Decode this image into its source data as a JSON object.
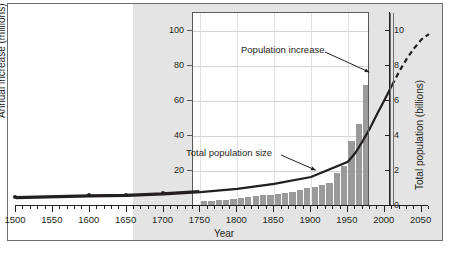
{
  "chart_data": {
    "type": "bar",
    "title": "",
    "subtitle": "",
    "xlabel": "Year",
    "ylabel": "Annual increase (millions)",
    "y2label": "Total population (billions)",
    "xlim": [
      1500,
      2060
    ],
    "ylim": [
      0,
      110
    ],
    "y2lim": [
      0,
      11
    ],
    "grid": true,
    "legend_position": "none",
    "x_major_ticks": [
      1500,
      1550,
      1600,
      1650,
      1700,
      1750,
      1800,
      1850,
      1900,
      1950,
      2000,
      2050
    ],
    "x_minor_tick_interval": 10,
    "y_ticks_left": [
      20,
      40,
      60,
      80,
      100
    ],
    "y_ticks_right": [
      0,
      2,
      4,
      6,
      8,
      10
    ],
    "present_year": 2010,
    "annotations": [
      {
        "text": "Population increase",
        "target_year": 1975,
        "target_value": 78
      },
      {
        "text": "Total population size",
        "target_year": 1905,
        "target_value": 1.7
      }
    ],
    "series": [
      {
        "name": "Annual increase (millions per year)",
        "type": "bar",
        "unit": "millions",
        "axis": "left",
        "categories": [
          1750,
          1760,
          1770,
          1780,
          1790,
          1800,
          1810,
          1820,
          1830,
          1840,
          1850,
          1860,
          1870,
          1880,
          1890,
          1900,
          1910,
          1920,
          1930,
          1940,
          1950,
          1960,
          1970,
          1980,
          1990,
          2000,
          2010,
          2020,
          2030,
          2040,
          2050
        ],
        "values": [
          3,
          3,
          3.5,
          3.5,
          4,
          4.5,
          5,
          5.5,
          6,
          6.5,
          7,
          7.5,
          8,
          9,
          10,
          11,
          12,
          13,
          19,
          23,
          37,
          47,
          69,
          77,
          84,
          79,
          78,
          70,
          57,
          44,
          33
        ],
        "projected_from": 2010
      },
      {
        "name": "Total population size (billions)",
        "type": "line",
        "unit": "billions",
        "axis": "right",
        "x": [
          1500,
          1600,
          1650,
          1700,
          1750,
          1800,
          1850,
          1900,
          1950,
          1960,
          1970,
          1980,
          1990,
          2000,
          2010,
          2020,
          2030,
          2040,
          2050,
          2060
        ],
        "values": [
          0.45,
          0.55,
          0.58,
          0.66,
          0.79,
          0.98,
          1.26,
          1.65,
          2.52,
          3.02,
          3.7,
          4.43,
          5.27,
          6.07,
          6.9,
          7.7,
          8.4,
          9.0,
          9.5,
          9.8
        ],
        "projected_from": 2010,
        "projected_style": "dashed"
      }
    ],
    "early_data_points": [
      {
        "year": 1500,
        "value": 0.45
      },
      {
        "year": 1600,
        "value": 0.55
      },
      {
        "year": 1650,
        "value": 0.58
      },
      {
        "year": 1700,
        "value": 0.66
      }
    ],
    "colors": {
      "bar_historical": "#9a9a9a",
      "bar_projected": "#cfcfcf",
      "line": "#231f20",
      "shaded_band": "#e4e4e4",
      "grid": "#d4d4d4",
      "axis": "#231f20"
    }
  }
}
